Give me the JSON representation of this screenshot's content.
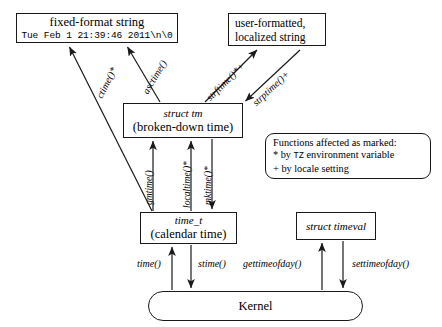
{
  "diagram": {
    "nodes": {
      "fixed_format": {
        "line1": "fixed-format string",
        "line2": "Tue Feb  1 21:39:46 2011\\n\\0"
      },
      "user_formatted": {
        "line1": "user-formatted,",
        "line2": "localized string"
      },
      "struct_tm": {
        "line1": "struct tm",
        "line2": "(broken-down time)"
      },
      "time_t": {
        "line1": "time_t",
        "line2": "(calendar time)"
      },
      "struct_timeval": {
        "line1": "struct timeval"
      },
      "kernel": {
        "line1": "Kernel"
      },
      "legend": {
        "line1": "Functions affected as marked:",
        "line2_prefix": "* by ",
        "line2_tz": "TZ",
        "line2_suffix": " environment variable",
        "line3": "+ by locale setting"
      }
    },
    "edge_labels": {
      "ctime": "ctime()*",
      "asctime": "asctime()",
      "strftime": "strftime()*+",
      "strptime": "strptime()+",
      "gmtime": "gmtime()",
      "localtime": "localtime()*",
      "mktime": "mktime()*",
      "time": "time()",
      "stime": "stime()",
      "gettimeofday": "gettimeofday()",
      "settimeofday": "settimeofday()"
    },
    "colors": {
      "stroke": "#1a1a1a",
      "background": "#ffffff",
      "text": "#000000"
    }
  }
}
